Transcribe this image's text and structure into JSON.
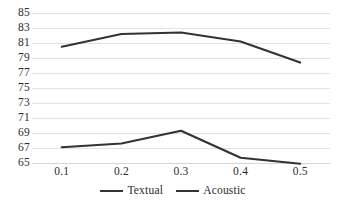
{
  "chart_data": {
    "type": "line",
    "title": "",
    "subtitle": "",
    "xlabel": "",
    "ylabel": "",
    "x": [
      0.1,
      0.2,
      0.3,
      0.4,
      0.5
    ],
    "categories": [
      "0.1",
      "0.2",
      "0.3",
      "0.4",
      "0.5"
    ],
    "series": [
      {
        "name": "Textual",
        "values": [
          80.5,
          82.2,
          82.4,
          81.2,
          78.4
        ],
        "color": "#333333"
      },
      {
        "name": "Acoustic",
        "values": [
          67.1,
          67.6,
          69.3,
          65.7,
          64.9
        ],
        "color": "#333333"
      }
    ],
    "ylim": [
      65,
      85
    ],
    "yticks": [
      85,
      83,
      81,
      79,
      77,
      75,
      73,
      71,
      69,
      67,
      65
    ],
    "ytick_labels": [
      "85",
      "83",
      "81",
      "79",
      "77",
      "75",
      "73",
      "71",
      "69",
      "67",
      "65"
    ],
    "xtick_labels": [
      "0.1",
      "0.2",
      "0.3",
      "0.4",
      "0.5"
    ],
    "grid": true,
    "grid_axis": "y",
    "grid_color": "#e2e2e2",
    "legend": [
      "Textual",
      "Acoustic"
    ],
    "legend_position": "bottom-center",
    "background_color": "#ffffff",
    "line_width": 2.2
  }
}
